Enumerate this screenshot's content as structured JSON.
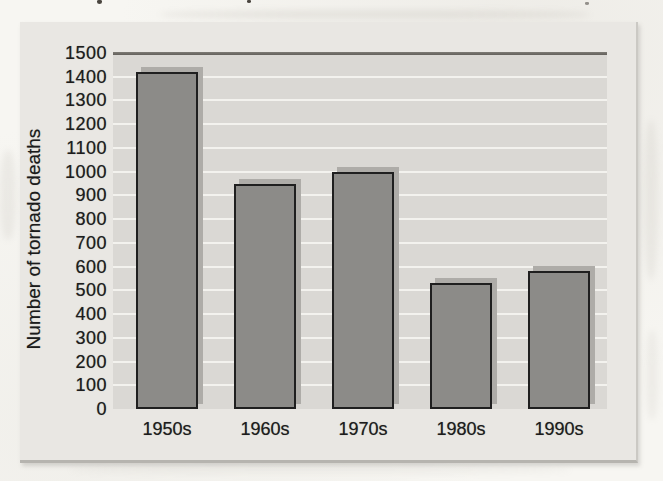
{
  "chart_data": {
    "type": "bar",
    "title": "",
    "xlabel": "",
    "ylabel": "Number of tornado deaths",
    "categories": [
      "1950s",
      "1960s",
      "1970s",
      "1980s",
      "1990s"
    ],
    "values": [
      1420,
      950,
      1000,
      530,
      580
    ],
    "ylim": [
      0,
      1500
    ],
    "yticks": [
      0,
      100,
      200,
      300,
      400,
      500,
      600,
      700,
      800,
      900,
      1000,
      1100,
      1200,
      1300,
      1400,
      1500
    ],
    "grid": true,
    "gridline_orientation": "horizontal",
    "legend": false
  },
  "colors": {
    "page_background": "#f7f6f2",
    "panel_background": "#e9e7e3",
    "plot_background": "#dad8d4",
    "gridline": "#f3f2ee",
    "bar_fill": "#8c8b88",
    "bar_border": "#1f1f1f",
    "bar_shadow": "#aeaca8",
    "plot_top_border": "#54514c",
    "text": "#1c1c1c"
  }
}
